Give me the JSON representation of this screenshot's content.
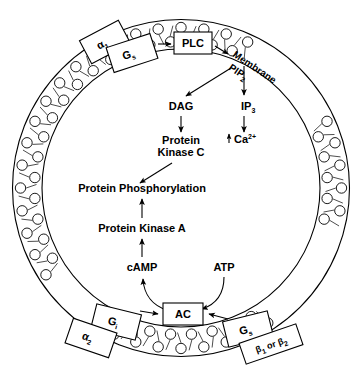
{
  "diagram": {
    "background_color": "#ffffff",
    "line_color": "#000000"
  },
  "membrane": {
    "label_line1": "Membrane",
    "label_line2_base": "PIP",
    "label_line2_sub": "2",
    "structure": "phospholipid-bilayer",
    "outer_radius": 168,
    "inner_radius": 139,
    "head_count": 44
  },
  "receptors": [
    {
      "id": "alpha1",
      "base": "α",
      "sub": "1",
      "position": "top-left"
    },
    {
      "id": "alpha2",
      "base": "α",
      "sub": "2",
      "position": "bottom-left"
    },
    {
      "id": "beta1_or_beta2",
      "base": "β",
      "sub": "1",
      "mid": " or β",
      "sub2": "2",
      "position": "bottom-right"
    }
  ],
  "g_proteins": [
    {
      "id": "gs_top",
      "base": "G",
      "sub": "s",
      "position": "top-left"
    },
    {
      "id": "gi",
      "base": "G",
      "sub": "i",
      "position": "bottom-left"
    },
    {
      "id": "gs_bottom",
      "base": "G",
      "sub": "s",
      "position": "bottom-right"
    }
  ],
  "enzymes": [
    {
      "id": "plc",
      "label": "PLC",
      "boxed": true
    },
    {
      "id": "ac",
      "label": "AC",
      "boxed": true
    }
  ],
  "messengers": {
    "dag": "DAG",
    "ip3_base": "IP",
    "ip3_sub": "3",
    "calcium_arrow": "↑",
    "calcium_base": "Ca",
    "calcium_sup": "2+",
    "camp": "cAMP",
    "atp": "ATP"
  },
  "kinases": {
    "pkc_line1": "Protein",
    "pkc_line2": "Kinase C",
    "pka": "Protein Kinase A"
  },
  "output": {
    "label": "Protein Phosphorylation"
  },
  "arrows": [
    {
      "from": "gs_top",
      "to": "plc"
    },
    {
      "from": "plc",
      "to": "membrane_pip2"
    },
    {
      "from": "pip2",
      "to": "dag"
    },
    {
      "from": "pip2",
      "to": "ip3"
    },
    {
      "from": "dag",
      "to": "pkc"
    },
    {
      "from": "ip3",
      "to": "calcium"
    },
    {
      "from": "pkc",
      "to": "protein_phosphorylation"
    },
    {
      "from": "pka",
      "to": "protein_phosphorylation"
    },
    {
      "from": "camp",
      "to": "pka"
    },
    {
      "from": "atp",
      "to": "ac",
      "style": "curved"
    },
    {
      "from": "ac",
      "to": "camp",
      "style": "curved"
    },
    {
      "from": "gi",
      "to": "ac"
    },
    {
      "from": "gs_bottom",
      "to": "ac"
    }
  ]
}
